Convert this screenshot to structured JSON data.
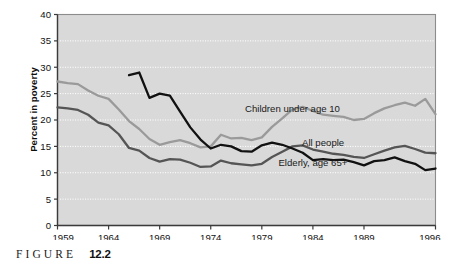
{
  "figure": {
    "caption_word": "FIGURE",
    "caption_number": "12.2"
  },
  "chart_data": {
    "type": "line",
    "title": "",
    "subtitle": "",
    "xlabel": "",
    "ylabel": "Percent in poverty",
    "xlim": [
      1959,
      1996
    ],
    "ylim": [
      0,
      40
    ],
    "ytick_labels": [
      "0",
      "5",
      "10",
      "15",
      "20",
      "25",
      "30",
      "35",
      "40"
    ],
    "yticks": [
      0,
      5,
      10,
      15,
      20,
      25,
      30,
      35,
      40
    ],
    "xtick_labels": [
      "1959",
      "1964",
      "1969",
      "1974",
      "1979",
      "1984",
      "1989",
      "1996"
    ],
    "xticks": [
      1959,
      1964,
      1969,
      1974,
      1979,
      1984,
      1989,
      1996
    ],
    "grid": true,
    "grid_style": "dotted",
    "grid_axis": "y",
    "legend_position": "inline-annotations",
    "plot_background": "#d9d9d9",
    "series": [
      {
        "name": "Children under age 10",
        "color": "#9a9a9a",
        "label_x": 1982,
        "label_y": 21.5,
        "x": [
          1959,
          1960,
          1961,
          1962,
          1963,
          1964,
          1965,
          1966,
          1967,
          1968,
          1969,
          1970,
          1971,
          1972,
          1973,
          1974,
          1975,
          1976,
          1977,
          1978,
          1979,
          1980,
          1981,
          1982,
          1983,
          1984,
          1985,
          1986,
          1987,
          1988,
          1989,
          1990,
          1991,
          1992,
          1993,
          1994,
          1995,
          1996
        ],
        "values": [
          27.3,
          27.0,
          26.8,
          25.6,
          24.6,
          24.0,
          22.0,
          19.8,
          18.3,
          16.4,
          15.3,
          15.8,
          16.2,
          15.6,
          14.8,
          15.0,
          17.2,
          16.5,
          16.6,
          16.2,
          16.7,
          18.7,
          20.3,
          22.0,
          22.5,
          21.7,
          21.0,
          20.8,
          20.6,
          20.0,
          20.2,
          21.3,
          22.2,
          22.8,
          23.3,
          22.7,
          24.0,
          21.1
        ]
      },
      {
        "name": "All people",
        "color": "#555555",
        "label_x": 1985,
        "label_y": 15.1,
        "x": [
          1959,
          1960,
          1961,
          1962,
          1963,
          1964,
          1965,
          1966,
          1967,
          1968,
          1969,
          1970,
          1971,
          1972,
          1973,
          1974,
          1975,
          1976,
          1977,
          1978,
          1979,
          1980,
          1981,
          1982,
          1983,
          1984,
          1985,
          1986,
          1987,
          1988,
          1989,
          1990,
          1991,
          1992,
          1993,
          1994,
          1995,
          1996
        ],
        "values": [
          22.4,
          22.2,
          21.9,
          21.0,
          19.5,
          19.0,
          17.3,
          14.7,
          14.2,
          12.8,
          12.1,
          12.6,
          12.5,
          11.9,
          11.1,
          11.2,
          12.3,
          11.8,
          11.6,
          11.4,
          11.7,
          13.0,
          14.0,
          15.0,
          15.2,
          14.4,
          14.0,
          13.6,
          13.4,
          13.0,
          12.8,
          13.5,
          14.2,
          14.8,
          15.1,
          14.5,
          13.8,
          13.7
        ]
      },
      {
        "name": "Elderly, age 65+",
        "color": "#111111",
        "label_x": 1984,
        "label_y": 11.2,
        "x": [
          1966,
          1967,
          1968,
          1969,
          1970,
          1971,
          1972,
          1973,
          1974,
          1975,
          1976,
          1977,
          1978,
          1979,
          1980,
          1981,
          1982,
          1983,
          1984,
          1985,
          1986,
          1987,
          1988,
          1989,
          1990,
          1991,
          1992,
          1993,
          1994,
          1995,
          1996
        ],
        "values": [
          28.5,
          29.0,
          24.2,
          25.0,
          24.6,
          21.6,
          18.6,
          16.3,
          14.6,
          15.3,
          15.0,
          14.1,
          14.0,
          15.2,
          15.7,
          15.3,
          14.6,
          13.8,
          12.4,
          12.6,
          12.4,
          12.5,
          12.0,
          11.4,
          12.2,
          12.4,
          12.9,
          12.2,
          11.7,
          10.5,
          10.8
        ]
      }
    ]
  }
}
